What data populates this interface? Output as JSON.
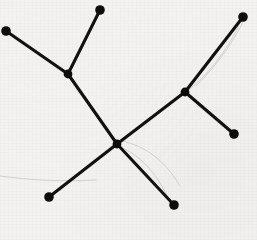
{
  "figure": {
    "medium": "scanned black ink drawing on textured off-white paper",
    "canvas": {
      "width": 257,
      "height": 240
    },
    "colors": {
      "background": "#f3f2f0",
      "ink": "#111110",
      "node_fill": "#0d0d0c",
      "artifact": "#c9c8c6",
      "bleed_text": "#e4e3e0"
    },
    "style": {
      "edge_stroke_width": 3.1,
      "node_radius": 4.8,
      "leaf_node_radius": 4.8,
      "internal_node_radius": 4.4
    }
  },
  "chart_data": {
    "type": "graph",
    "subtype": "unrooted-tree",
    "node_count": 11,
    "edge_count": 10,
    "leaf_count": 8,
    "internal_count": 3,
    "nodes": [
      {
        "id": "L1",
        "label": "",
        "role": "leaf",
        "x": 6,
        "y": 31
      },
      {
        "id": "L2",
        "label": "",
        "role": "leaf",
        "x": 100,
        "y": 10
      },
      {
        "id": "I1",
        "label": "",
        "role": "internal",
        "x": 68,
        "y": 74
      },
      {
        "id": "H",
        "label": "",
        "role": "internal",
        "x": 117,
        "y": 144
      },
      {
        "id": "I2",
        "label": "",
        "role": "internal",
        "x": 185,
        "y": 92
      },
      {
        "id": "L3",
        "label": "",
        "role": "leaf",
        "x": 243,
        "y": 17
      },
      {
        "id": "L4",
        "label": "",
        "role": "leaf",
        "x": 234,
        "y": 134
      },
      {
        "id": "L5",
        "label": "",
        "role": "leaf",
        "x": 49,
        "y": 197
      },
      {
        "id": "L6",
        "label": "",
        "role": "leaf",
        "x": 174,
        "y": 205
      }
    ],
    "edges": [
      {
        "id": "e1",
        "source": "L1",
        "target": "I1",
        "label": ""
      },
      {
        "id": "e2",
        "source": "L2",
        "target": "I1",
        "label": ""
      },
      {
        "id": "e3",
        "source": "I1",
        "target": "H",
        "label": ""
      },
      {
        "id": "e4",
        "source": "H",
        "target": "I2",
        "label": ""
      },
      {
        "id": "e5",
        "source": "I2",
        "target": "L3",
        "label": ""
      },
      {
        "id": "e6",
        "source": "I2",
        "target": "L4",
        "label": ""
      },
      {
        "id": "e7",
        "source": "H",
        "target": "L5",
        "label": ""
      },
      {
        "id": "e8",
        "source": "H",
        "target": "L6",
        "label": ""
      }
    ],
    "annotations": [],
    "xlabel": "",
    "ylabel": "",
    "legend": [],
    "grid": false
  },
  "artifacts": {
    "description": "faint scan/pencil scratches and reverse-side bleed-through",
    "scratches": [
      {
        "id": "a1",
        "path": "M 243 22 C 230 48, 214 68, 196 86"
      },
      {
        "id": "a2",
        "path": "M 238 28 C 224 54, 208 74, 189 90"
      },
      {
        "id": "a3",
        "path": "M 122 141 C 145 146, 165 160, 180 186"
      },
      {
        "id": "a4",
        "path": "M 120 147 C 140 155, 156 172, 168 198"
      },
      {
        "id": "a5",
        "path": "M 0 176 C 30 180, 60 182, 96 180"
      }
    ],
    "bleed_text_rows": [
      {
        "id": "b1",
        "text": "",
        "x": 36,
        "y": 46
      },
      {
        "id": "b2",
        "text": "",
        "x": 28,
        "y": 60
      },
      {
        "id": "b3",
        "text": "",
        "x": 46,
        "y": 74
      },
      {
        "id": "b4",
        "text": "",
        "x": 150,
        "y": 40
      },
      {
        "id": "b5",
        "text": "",
        "x": 150,
        "y": 56
      },
      {
        "id": "b6",
        "text": "",
        "x": 60,
        "y": 232
      }
    ]
  }
}
